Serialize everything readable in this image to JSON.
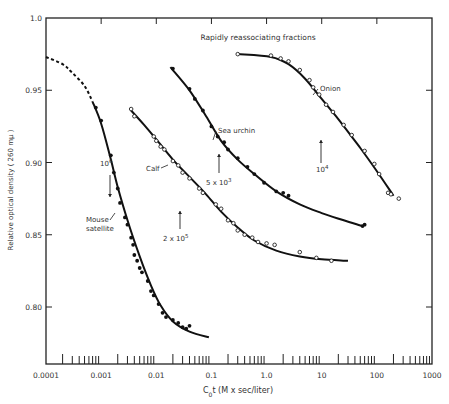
{
  "chart_data": {
    "type": "scatter",
    "title": "Rapidly reassociating fractions",
    "xlabel": "C0t (M x sec/liter)",
    "xlabel_main": "C",
    "xlabel_sub": "0",
    "xlabel_rest": "t (M x sec/liter)",
    "ylabel": "Relative optical density ( 260 mμ )",
    "xscale": "log",
    "xlim": [
      0.0001,
      1000
    ],
    "ylim": [
      0.76,
      1.0
    ],
    "x_ticks": [
      "0.0001",
      "0.001",
      "0.01",
      "0.1",
      "1.0",
      "10",
      "100",
      "1000"
    ],
    "x_tick_values": [
      0.0001,
      0.001,
      0.01,
      0.1,
      1,
      10,
      100,
      1000
    ],
    "y_ticks": [
      "0.80",
      "0.85",
      "0.90",
      "0.95",
      "1.0"
    ],
    "y_tick_values": [
      0.8,
      0.85,
      0.9,
      0.95,
      1.0
    ],
    "grid": false,
    "legend": "none (curves labeled inline)",
    "series": [
      {
        "name": "Mouse satellite",
        "marker": "filled-circle",
        "label": [
          "Mouse",
          "satellite"
        ],
        "annotation": "10^6",
        "annotation_x": 0.0016,
        "points": [
          [
            0.0008,
            0.938
          ],
          [
            0.001,
            0.929
          ],
          [
            0.0015,
            0.905
          ],
          [
            0.0017,
            0.893
          ],
          [
            0.002,
            0.882
          ],
          [
            0.0022,
            0.872
          ],
          [
            0.0027,
            0.862
          ],
          [
            0.003,
            0.857
          ],
          [
            0.0035,
            0.848
          ],
          [
            0.0038,
            0.843
          ],
          [
            0.004,
            0.836
          ],
          [
            0.0045,
            0.832
          ],
          [
            0.005,
            0.827
          ],
          [
            0.0055,
            0.824
          ],
          [
            0.007,
            0.818
          ],
          [
            0.008,
            0.811
          ],
          [
            0.009,
            0.808
          ],
          [
            0.011,
            0.802
          ],
          [
            0.013,
            0.796
          ],
          [
            0.015,
            0.793
          ],
          [
            0.02,
            0.791
          ],
          [
            0.025,
            0.789
          ],
          [
            0.03,
            0.786
          ],
          [
            0.035,
            0.785
          ],
          [
            0.04,
            0.787
          ]
        ],
        "curve": [
          [
            0.0001,
            0.973
          ],
          [
            0.0002,
            0.968
          ],
          [
            0.0003,
            0.962
          ],
          [
            0.0005,
            0.953
          ],
          [
            0.0007,
            0.942
          ],
          [
            0.001,
            0.927
          ],
          [
            0.0015,
            0.902
          ],
          [
            0.002,
            0.883
          ],
          [
            0.003,
            0.86
          ],
          [
            0.005,
            0.835
          ],
          [
            0.008,
            0.815
          ],
          [
            0.012,
            0.801
          ],
          [
            0.02,
            0.79
          ],
          [
            0.04,
            0.783
          ],
          [
            0.09,
            0.779
          ]
        ],
        "dashed_until": 0.0007
      },
      {
        "name": "Calf",
        "marker": "open-circle",
        "label": [
          "Calf"
        ],
        "annotation": "2 x 10^5",
        "annotation_x": 0.03,
        "points": [
          [
            0.0035,
            0.937
          ],
          [
            0.004,
            0.932
          ],
          [
            0.009,
            0.918
          ],
          [
            0.01,
            0.915
          ],
          [
            0.012,
            0.911
          ],
          [
            0.014,
            0.909
          ],
          [
            0.02,
            0.901
          ],
          [
            0.025,
            0.898
          ],
          [
            0.03,
            0.893
          ],
          [
            0.04,
            0.889
          ],
          [
            0.06,
            0.882
          ],
          [
            0.07,
            0.879
          ],
          [
            0.12,
            0.871
          ],
          [
            0.15,
            0.868
          ],
          [
            0.2,
            0.86
          ],
          [
            0.25,
            0.858
          ],
          [
            0.3,
            0.853
          ],
          [
            0.4,
            0.85
          ],
          [
            0.55,
            0.848
          ],
          [
            0.7,
            0.845
          ],
          [
            1.0,
            0.844
          ],
          [
            1.4,
            0.843
          ],
          [
            4.0,
            0.838
          ],
          [
            8.0,
            0.834
          ],
          [
            15.0,
            0.832
          ]
        ],
        "curve": [
          [
            0.0035,
            0.936
          ],
          [
            0.006,
            0.926
          ],
          [
            0.01,
            0.916
          ],
          [
            0.02,
            0.902
          ],
          [
            0.04,
            0.89
          ],
          [
            0.08,
            0.878
          ],
          [
            0.15,
            0.866
          ],
          [
            0.3,
            0.855
          ],
          [
            0.6,
            0.846
          ],
          [
            1.5,
            0.839
          ],
          [
            4,
            0.835
          ],
          [
            10,
            0.833
          ],
          [
            30,
            0.832
          ]
        ]
      },
      {
        "name": "Sea urchin",
        "marker": "filled-circle",
        "label": [
          "Sea urchin"
        ],
        "annotation": "5 x 10^3",
        "annotation_x": 0.22,
        "points": [
          [
            0.02,
            0.965
          ],
          [
            0.04,
            0.951
          ],
          [
            0.05,
            0.944
          ],
          [
            0.07,
            0.936
          ],
          [
            0.1,
            0.925
          ],
          [
            0.13,
            0.918
          ],
          [
            0.17,
            0.914
          ],
          [
            0.2,
            0.909
          ],
          [
            0.3,
            0.903
          ],
          [
            0.45,
            0.897
          ],
          [
            0.6,
            0.892
          ],
          [
            0.9,
            0.886
          ],
          [
            1.5,
            0.88
          ],
          [
            2.0,
            0.879
          ],
          [
            2.5,
            0.877
          ],
          [
            55,
            0.856
          ],
          [
            60,
            0.857
          ]
        ],
        "curve": [
          [
            0.018,
            0.966
          ],
          [
            0.04,
            0.95
          ],
          [
            0.08,
            0.932
          ],
          [
            0.15,
            0.915
          ],
          [
            0.3,
            0.902
          ],
          [
            0.6,
            0.892
          ],
          [
            1.5,
            0.88
          ],
          [
            4,
            0.871
          ],
          [
            10,
            0.865
          ],
          [
            25,
            0.86
          ],
          [
            55,
            0.856
          ]
        ]
      },
      {
        "name": "Onion",
        "marker": "open-circle",
        "label": [
          "Onion"
        ],
        "annotation": "10^4",
        "annotation_x": 9.0,
        "points": [
          [
            0.3,
            0.975
          ],
          [
            1.2,
            0.974
          ],
          [
            1.8,
            0.972
          ],
          [
            2.5,
            0.97
          ],
          [
            4.0,
            0.964
          ],
          [
            6.0,
            0.957
          ],
          [
            7.0,
            0.952
          ],
          [
            9.0,
            0.947
          ],
          [
            12,
            0.94
          ],
          [
            16,
            0.935
          ],
          [
            25,
            0.926
          ],
          [
            35,
            0.919
          ],
          [
            60,
            0.908
          ],
          [
            90,
            0.899
          ],
          [
            110,
            0.892
          ],
          [
            160,
            0.879
          ],
          [
            180,
            0.878
          ],
          [
            250,
            0.875
          ]
        ],
        "curve": [
          [
            0.3,
            0.975
          ],
          [
            1.2,
            0.973
          ],
          [
            2.5,
            0.968
          ],
          [
            5,
            0.958
          ],
          [
            10,
            0.944
          ],
          [
            20,
            0.93
          ],
          [
            50,
            0.91
          ],
          [
            100,
            0.894
          ],
          [
            200,
            0.877
          ]
        ]
      }
    ]
  }
}
